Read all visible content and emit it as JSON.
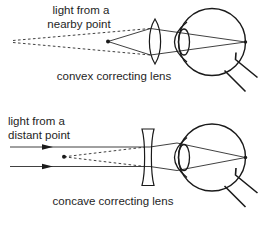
{
  "colors": {
    "background": "#ffffff",
    "line": "#1a1a1a",
    "ray": "#2b2b2b",
    "text": "#1e1e1e"
  },
  "top_diagram": {
    "label_line1": "light from a",
    "label_line2": "nearby point",
    "caption": "convex correcting lens",
    "lens_type": "convex",
    "source": "nearby point with dashed virtual-ray extensions"
  },
  "bottom_diagram": {
    "label_line1": "light from a",
    "label_line2": "distant point",
    "caption": "concave correcting lens",
    "lens_type": "concave",
    "source": "parallel rays with arrowheads and dashed virtual focus point"
  }
}
